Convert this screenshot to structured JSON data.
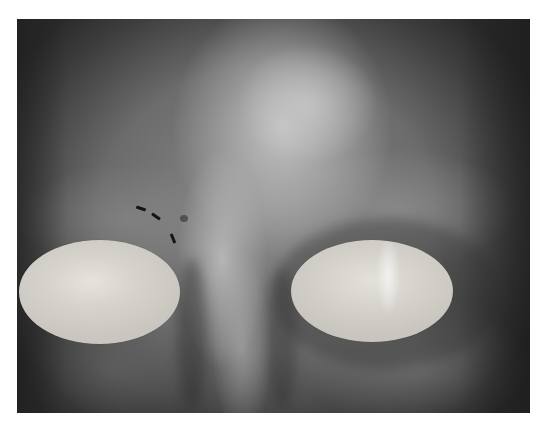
{
  "image": {
    "description": "Grayscale clinical photograph of the upper face (forehead and periorbital region) with both eyes covered by light oval shields and a dashed line marking near the left eyebrow / glabella.",
    "color_mode": "grayscale",
    "photo_bounds": {
      "left": 17,
      "top": 19,
      "width": 513,
      "height": 394
    },
    "eye_covers": [
      {
        "side": "image-left",
        "center": [
          99,
          292
        ],
        "rx": 80,
        "ry": 52,
        "color": "#d6d3cc"
      },
      {
        "side": "image-right",
        "center": [
          372,
          291
        ],
        "rx": 81,
        "ry": 51,
        "color": "#d5d2cb"
      }
    ],
    "marking": {
      "style": "dashed",
      "color": "#141414",
      "segments": 3,
      "location": "medial end of image-left eyebrow"
    },
    "background_color": "#ffffff"
  }
}
